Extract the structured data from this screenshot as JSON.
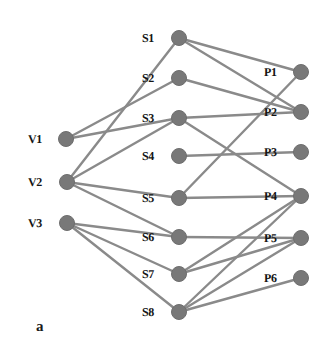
{
  "figure": {
    "caption": "a",
    "caption_x": 36,
    "caption_y": 318,
    "width": 329,
    "height": 358,
    "background_color": "#ffffff",
    "node_color": "#787878",
    "node_stroke_color": "#6e6e6e",
    "edge_color": "#8a8a8a",
    "label_color": "#151515",
    "node_radius": 7.5,
    "edge_width": 2.4
  },
  "chart_data": {
    "type": "diagram",
    "title": "a",
    "layout": "tripartite layered graph, three columns left-to-right",
    "columns": [
      {
        "name": "V",
        "x": 66,
        "label_side": "left"
      },
      {
        "name": "S",
        "x": 179,
        "label_side": "left"
      },
      {
        "name": "P",
        "x": 301,
        "label_side": "left"
      }
    ],
    "nodes": [
      {
        "id": "V1",
        "label": "V1",
        "x": 66,
        "y": 139,
        "label_x": 28,
        "label_y": 133,
        "group": "V"
      },
      {
        "id": "V2",
        "label": "V2",
        "x": 67,
        "y": 182,
        "label_x": 28,
        "label_y": 176,
        "group": "V"
      },
      {
        "id": "V3",
        "label": "V3",
        "x": 67,
        "y": 223,
        "label_x": 28,
        "label_y": 217,
        "group": "V"
      },
      {
        "id": "S1",
        "label": "S1",
        "x": 179,
        "y": 38,
        "label_x": 142,
        "label_y": 32,
        "group": "S"
      },
      {
        "id": "S2",
        "label": "S2",
        "x": 179,
        "y": 78,
        "label_x": 142,
        "label_y": 72,
        "group": "S"
      },
      {
        "id": "S3",
        "label": "S3",
        "x": 179,
        "y": 118,
        "label_x": 142,
        "label_y": 112,
        "group": "S"
      },
      {
        "id": "S4",
        "label": "S4",
        "x": 179,
        "y": 156,
        "label_x": 142,
        "label_y": 150,
        "group": "S"
      },
      {
        "id": "S5",
        "label": "S5",
        "x": 179,
        "y": 198,
        "label_x": 142,
        "label_y": 192,
        "group": "S"
      },
      {
        "id": "S6",
        "label": "S6",
        "x": 179,
        "y": 237,
        "label_x": 142,
        "label_y": 231,
        "group": "S"
      },
      {
        "id": "S7",
        "label": "S7",
        "x": 179,
        "y": 274,
        "label_x": 142,
        "label_y": 268,
        "group": "S"
      },
      {
        "id": "S8",
        "label": "S8",
        "x": 179,
        "y": 312,
        "label_x": 142,
        "label_y": 306,
        "group": "S"
      },
      {
        "id": "P1",
        "label": "P1",
        "x": 301,
        "y": 72,
        "label_x": 264,
        "label_y": 66,
        "group": "P"
      },
      {
        "id": "P2",
        "label": "P2",
        "x": 301,
        "y": 112,
        "label_x": 264,
        "label_y": 106,
        "group": "P"
      },
      {
        "id": "P3",
        "label": "P3",
        "x": 301,
        "y": 152,
        "label_x": 264,
        "label_y": 146,
        "group": "P"
      },
      {
        "id": "P4",
        "label": "P4",
        "x": 301,
        "y": 196,
        "label_x": 264,
        "label_y": 190,
        "group": "P"
      },
      {
        "id": "P5",
        "label": "P5",
        "x": 301,
        "y": 238,
        "label_x": 264,
        "label_y": 232,
        "group": "P"
      },
      {
        "id": "P6",
        "label": "P6",
        "x": 301,
        "y": 278,
        "label_x": 264,
        "label_y": 272,
        "group": "P"
      }
    ],
    "edges": [
      {
        "from": "V1",
        "to": "S2"
      },
      {
        "from": "V1",
        "to": "S3"
      },
      {
        "from": "V2",
        "to": "S1"
      },
      {
        "from": "V2",
        "to": "S3"
      },
      {
        "from": "V2",
        "to": "S5"
      },
      {
        "from": "V2",
        "to": "S6"
      },
      {
        "from": "V3",
        "to": "S6"
      },
      {
        "from": "V3",
        "to": "S7"
      },
      {
        "from": "V3",
        "to": "S8"
      },
      {
        "from": "S1",
        "to": "P1"
      },
      {
        "from": "S1",
        "to": "P2"
      },
      {
        "from": "S2",
        "to": "P2"
      },
      {
        "from": "S3",
        "to": "P2"
      },
      {
        "from": "S3",
        "to": "P4"
      },
      {
        "from": "S4",
        "to": "P3"
      },
      {
        "from": "S5",
        "to": "P1"
      },
      {
        "from": "S5",
        "to": "P4"
      },
      {
        "from": "S6",
        "to": "P5"
      },
      {
        "from": "S7",
        "to": "P4"
      },
      {
        "from": "S7",
        "to": "P5"
      },
      {
        "from": "S8",
        "to": "P4"
      },
      {
        "from": "S8",
        "to": "P5"
      },
      {
        "from": "S8",
        "to": "P6"
      }
    ]
  }
}
